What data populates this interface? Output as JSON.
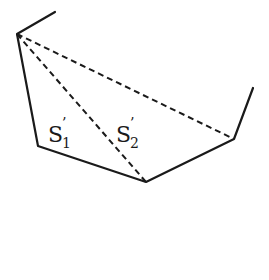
{
  "diagram": {
    "type": "polygon-triangulation",
    "vertices": {
      "top_start": [
        55,
        12
      ],
      "apex": [
        17,
        34
      ],
      "bottom_left": [
        38,
        146
      ],
      "bottom": [
        146,
        182
      ],
      "right": [
        234,
        139
      ],
      "right_end": [
        253,
        88
      ]
    },
    "solid_edges": [
      [
        "top_start",
        "apex"
      ],
      [
        "apex",
        "bottom_left"
      ],
      [
        "bottom_left",
        "bottom"
      ],
      [
        "bottom",
        "right"
      ],
      [
        "right",
        "right_end"
      ]
    ],
    "dashed_diagonals": [
      [
        "apex",
        "bottom"
      ],
      [
        "apex",
        "right"
      ]
    ],
    "labels": [
      {
        "id": "s1",
        "base": "S",
        "sub": "1",
        "prime": "’",
        "x": 48,
        "y": 142
      },
      {
        "id": "s2",
        "base": "S",
        "sub": "2",
        "prime": "’",
        "x": 116,
        "y": 142
      }
    ]
  }
}
